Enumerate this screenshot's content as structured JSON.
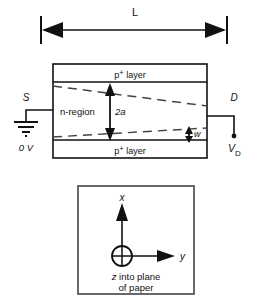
{
  "figure": {
    "dimension_label": "L",
    "device": {
      "top_layer_label": "p+ layer",
      "bottom_layer_label": "p+ layer",
      "channel_label": "n-region",
      "channel_width_label": "2a",
      "depletion_width_label": "w"
    },
    "terminals": {
      "source_label": "S",
      "source_voltage_label": "0 V",
      "drain_label": "D",
      "drain_voltage_label": "V",
      "drain_voltage_subscript": "D"
    },
    "inset": {
      "x_axis_label": "x",
      "y_axis_label": "y",
      "z_note_line1": "z into plane",
      "z_note_line2": "of paper",
      "z_symbol": "circle-cross-icon"
    },
    "colors": {
      "line": "#111111",
      "dashed": "#555555",
      "background": "#ffffff"
    }
  }
}
